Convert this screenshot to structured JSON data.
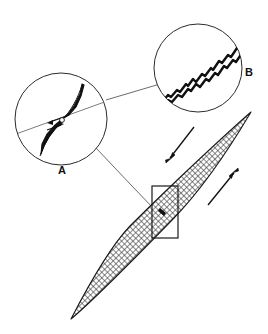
{
  "figure": {
    "background_color": "#ffffff",
    "ink_color": "#1a1a1a",
    "leader_line_color": "#5a5a5a",
    "hatch_color": "#2b2b2b",
    "width": 268,
    "height": 334
  },
  "insets": [
    {
      "id": "A",
      "label": "A",
      "label_x": 62,
      "label_y": 174,
      "center_x": 61,
      "center_y": 119,
      "radius": 47,
      "content": "angular-kinked-vein-with-shear-arrows",
      "description": "Magnified view of a dark kinked vein trace with two small opposed shear-sense arrows"
    },
    {
      "id": "B",
      "label": "B",
      "label_x": 249,
      "label_y": 76,
      "center_x": 198,
      "center_y": 68,
      "radius": 45,
      "content": "wavy-serrated-double-line",
      "description": "Magnified view of a wavy serrated double-line boundary running lower-left to upper-right"
    }
  ],
  "lens": {
    "name": "hatched-lens",
    "tip_upper_right_x": 251,
    "tip_upper_right_y": 112,
    "tip_lower_left_x": 71,
    "tip_lower_left_y": 319,
    "fill_pattern": "diagonal-cross-hatch",
    "fill_color": "#9a9a9a",
    "outline_color": "#1a1a1a"
  },
  "detail_box": {
    "name": "detail-rectangle",
    "x": 152,
    "y": 186,
    "width": 26,
    "height": 52,
    "stroke_color": "#1a1a1a"
  },
  "leaders": [
    {
      "name": "leader-a-to-b",
      "from": "circle-a",
      "to": "circle-b",
      "x1": 106,
      "y1": 100,
      "x2": 158,
      "y2": 84
    },
    {
      "name": "leader-a-to-detail-box",
      "from": "circle-a",
      "to": "detail-box",
      "x1": 96,
      "y1": 148,
      "x2": 155,
      "y2": 209
    }
  ],
  "arrows": [
    {
      "id": "arrow-left",
      "name": "shear-arrow-down-left",
      "direction": "down-left",
      "tail_x": 194,
      "tail_y": 127,
      "head_x": 166,
      "head_y": 163,
      "meaning": "top-block-moves-down-to-the-southwest"
    },
    {
      "id": "arrow-right",
      "name": "shear-arrow-up-right",
      "direction": "up-right",
      "tail_x": 208,
      "tail_y": 205,
      "head_x": 238,
      "head_y": 168,
      "meaning": "bottom-block-moves-up-to-the-northeast"
    }
  ],
  "microstructure_a": {
    "name": "kinked-vein-trace",
    "shear_arrows": 2
  },
  "microstructure_b": {
    "name": "serrated-boundary-trace",
    "line_count": 2
  }
}
